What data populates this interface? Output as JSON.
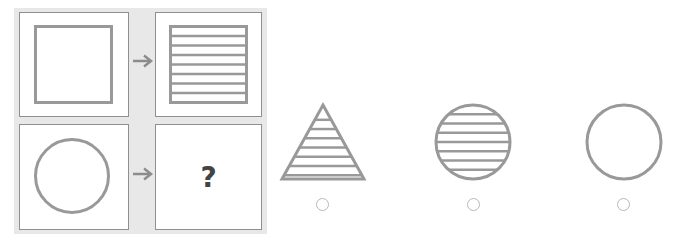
{
  "puzzle": {
    "type": "visual-analogy",
    "stroke_color": "#999999",
    "panel_background": "#e8e8e8",
    "rows": [
      {
        "source": {
          "shape": "square",
          "fill": "none"
        },
        "arrow": "arrow-right",
        "target": {
          "shape": "square",
          "fill": "horizontal-stripes",
          "stripe_lines": 7
        }
      },
      {
        "source": {
          "shape": "circle",
          "fill": "none"
        },
        "arrow": "arrow-right",
        "target": {
          "shape": "unknown",
          "label": "?"
        }
      }
    ]
  },
  "options": [
    {
      "shape": "triangle",
      "fill": "horizontal-stripes",
      "stripe_lines": 7,
      "selected": false
    },
    {
      "shape": "circle",
      "fill": "horizontal-stripes",
      "stripe_lines": 7,
      "selected": false
    },
    {
      "shape": "circle",
      "fill": "none",
      "selected": false
    }
  ]
}
